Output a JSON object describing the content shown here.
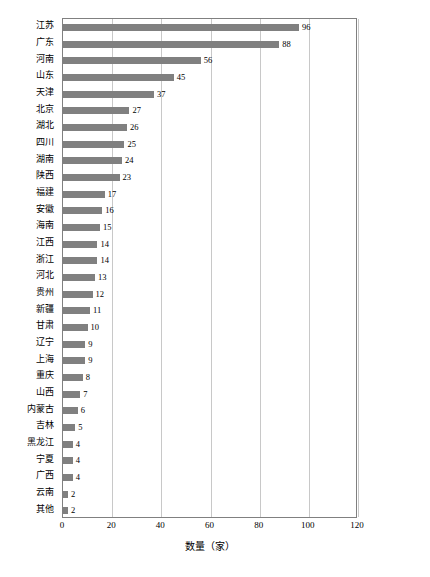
{
  "chart_data": {
    "type": "bar",
    "orientation": "horizontal",
    "title": "",
    "subtitle": "",
    "xlabel": "数量（家）",
    "ylabel": "",
    "xlim": [
      0,
      120
    ],
    "xticks": [
      0,
      20,
      40,
      60,
      80,
      100,
      120
    ],
    "xticklabels": [
      "0",
      "20",
      "40",
      "60",
      "80",
      "100",
      "120"
    ],
    "grid": "vertical",
    "legend": "none",
    "bar_color": "#808080",
    "categories": [
      "江苏",
      "广东",
      "河南",
      "山东",
      "天津",
      "北京",
      "湖北",
      "四川",
      "湖南",
      "陕西",
      "福建",
      "安徽",
      "海南",
      "江西",
      "浙江",
      "河北",
      "贵州",
      "新疆",
      "甘肃",
      "辽宁",
      "上海",
      "重庆",
      "山西",
      "内蒙古",
      "吉林",
      "黑龙江",
      "宁夏",
      "广西",
      "云南",
      "其他"
    ],
    "values": [
      96,
      88,
      56,
      45,
      37,
      27,
      26,
      25,
      24,
      23,
      17,
      16,
      15,
      14,
      14,
      13,
      12,
      11,
      10,
      9,
      9,
      8,
      7,
      6,
      5,
      4,
      4,
      4,
      2,
      2
    ],
    "data_labels": [
      "96",
      "88",
      "56",
      "45",
      "37",
      "27",
      "26",
      "25",
      "24",
      "23",
      "17",
      "16",
      "15",
      "14",
      "14",
      "13",
      "12",
      "11",
      "10",
      "9",
      "9",
      "8",
      "7",
      "6",
      "5",
      "4",
      "4",
      "4",
      "2",
      "2"
    ]
  }
}
